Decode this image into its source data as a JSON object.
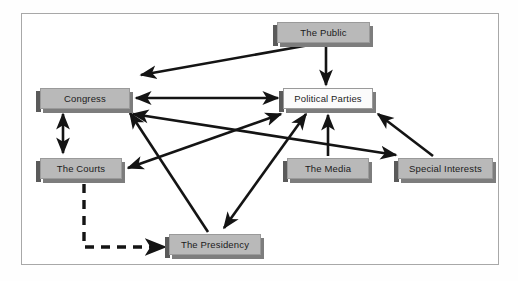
{
  "diagram": {
    "border_color": "#a8a8a8",
    "node_fill": "#b9b9b9",
    "node_fill_alt": "#fbfbfb",
    "arrow_color": "#141414",
    "nodes": [
      {
        "id": "public",
        "label": "The Public",
        "x": 277,
        "y": 22,
        "w": 93,
        "h": 21,
        "style": "gray"
      },
      {
        "id": "congress",
        "label": "Congress",
        "x": 40,
        "y": 88,
        "w": 90,
        "h": 21,
        "style": "gray"
      },
      {
        "id": "parties",
        "label": "Political Parties",
        "x": 283,
        "y": 88,
        "w": 90,
        "h": 21,
        "style": "white"
      },
      {
        "id": "courts",
        "label": "The Courts",
        "x": 40,
        "y": 158,
        "w": 82,
        "h": 21,
        "style": "gray"
      },
      {
        "id": "media",
        "label": "The Media",
        "x": 287,
        "y": 158,
        "w": 82,
        "h": 21,
        "style": "gray"
      },
      {
        "id": "interests",
        "label": "Special Interests",
        "x": 398,
        "y": 158,
        "w": 95,
        "h": 21,
        "style": "gray"
      },
      {
        "id": "presidency",
        "label": "The Presidency",
        "x": 169,
        "y": 234,
        "w": 92,
        "h": 21,
        "style": "gray"
      }
    ],
    "edges": [
      {
        "id": "public-to-congress",
        "from": "public",
        "to": "congress",
        "heads": "single",
        "dash": false
      },
      {
        "id": "public-to-parties",
        "from": "public",
        "to": "parties",
        "heads": "single",
        "dash": false
      },
      {
        "id": "congress-parties",
        "from": "congress",
        "to": "parties",
        "heads": "double",
        "dash": false
      },
      {
        "id": "congress-courts",
        "from": "congress",
        "to": "courts",
        "heads": "double",
        "dash": false
      },
      {
        "id": "courts-parties",
        "from": "courts",
        "to": "parties",
        "heads": "double",
        "dash": false
      },
      {
        "id": "congress-interests",
        "from": "congress",
        "to": "interests",
        "heads": "double",
        "dash": false
      },
      {
        "id": "presidency-parties",
        "from": "presidency",
        "to": "parties",
        "heads": "double",
        "dash": false
      },
      {
        "id": "presidency-to-congress",
        "from": "presidency",
        "to": "congress",
        "heads": "single",
        "dash": false
      },
      {
        "id": "media-to-parties",
        "from": "media",
        "to": "parties",
        "heads": "single",
        "dash": false
      },
      {
        "id": "interests-to-parties",
        "from": "interests",
        "to": "parties",
        "heads": "single",
        "dash": false
      },
      {
        "id": "courts-to-presidency",
        "from": "courts",
        "to": "presidency",
        "heads": "single",
        "dash": true
      }
    ]
  }
}
